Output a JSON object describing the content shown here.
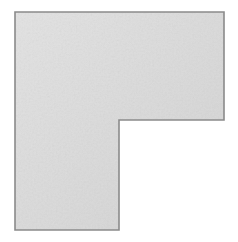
{
  "canvas": {
    "width": 238,
    "height": 242,
    "background_color": "#ffffff",
    "alt_text": "L-shaped gray polygon on white background"
  },
  "shape": {
    "name": "l-shaped-polygon",
    "orientation": "gamma",
    "fill_color": "#dcdcdc",
    "fill_color_light": "#e3e3e3",
    "fill_color_dark": "#d4d4d4",
    "stroke_color": "#8a8a8a",
    "stroke_width": 1.6,
    "texture": "subtle-mottled-noise",
    "points": "15,12 224,12 224,120 119,120 119,230 15,230",
    "vertices": [
      {
        "label": "top-left",
        "x": 15,
        "y": 12
      },
      {
        "label": "top-right",
        "x": 224,
        "y": 12
      },
      {
        "label": "right-notch-top",
        "x": 224,
        "y": 120
      },
      {
        "label": "inner-corner",
        "x": 119,
        "y": 120
      },
      {
        "label": "leg-bottom-right",
        "x": 119,
        "y": 230
      },
      {
        "label": "bottom-left",
        "x": 15,
        "y": 230
      }
    ],
    "edges": [
      {
        "name": "top-edge",
        "from": "top-left",
        "to": "top-right",
        "length": 209
      },
      {
        "name": "right-edge",
        "from": "top-right",
        "to": "right-notch-top",
        "length": 108
      },
      {
        "name": "notch-horizontal-edge",
        "from": "right-notch-top",
        "to": "inner-corner",
        "length": 105
      },
      {
        "name": "notch-vertical-edge",
        "from": "inner-corner",
        "to": "leg-bottom-right",
        "length": 110
      },
      {
        "name": "bottom-edge",
        "from": "leg-bottom-right",
        "to": "bottom-left",
        "length": 104
      },
      {
        "name": "left-edge",
        "from": "bottom-left",
        "to": "top-left",
        "length": 218
      }
    ]
  }
}
